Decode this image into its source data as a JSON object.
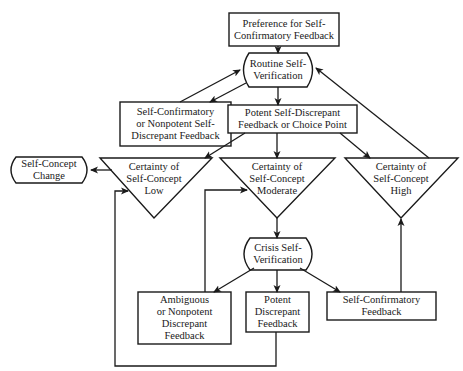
{
  "diagram": {
    "type": "flowchart",
    "colors": {
      "stroke": "#1a1a1a",
      "background": "#ffffff",
      "text": "#1a1a1a"
    },
    "nodes": {
      "preference": {
        "shape": "rectangle",
        "lines": [
          "Preference for Self-",
          "Confirmatory Feedback"
        ]
      },
      "routine": {
        "shape": "rounded-terminal",
        "lines": [
          "Routine Self-",
          "Verification"
        ]
      },
      "nonpotent": {
        "shape": "rectangle",
        "lines": [
          "Self-Confirmatory",
          "or Nonpotent Self-",
          "Discrepant Feedback"
        ]
      },
      "choice_point": {
        "shape": "rectangle",
        "lines": [
          "Potent Self-Discrepant",
          "Feedback or Choice Point"
        ]
      },
      "change": {
        "shape": "rounded-terminal",
        "lines": [
          "Self-Concept",
          "Change"
        ]
      },
      "low": {
        "shape": "inverted-triangle",
        "lines": [
          "Certainty of",
          "Self-Concept",
          "Low"
        ]
      },
      "moderate": {
        "shape": "inverted-triangle",
        "lines": [
          "Certainty of",
          "Self-Concept",
          "Moderate"
        ]
      },
      "high": {
        "shape": "inverted-triangle",
        "lines": [
          "Certainty of",
          "Self-Concept",
          "High"
        ]
      },
      "crisis": {
        "shape": "rounded-terminal",
        "lines": [
          "Crisis Self-",
          "Verification"
        ]
      },
      "ambiguous": {
        "shape": "rectangle",
        "lines": [
          "Ambiguous",
          "or Nonpotent",
          "Discrepant",
          "Feedback"
        ]
      },
      "potent": {
        "shape": "rectangle",
        "lines": [
          "Potent",
          "Discrepant",
          "Feedback"
        ]
      },
      "confirm_bottom": {
        "shape": "rectangle",
        "lines": [
          "Self-Confirmatory",
          "Feedback"
        ]
      }
    },
    "edges": [
      {
        "from": "preference",
        "to": "routine"
      },
      {
        "from": "routine",
        "to": "nonpotent"
      },
      {
        "from": "nonpotent",
        "to": "routine"
      },
      {
        "from": "routine",
        "to": "choice_point"
      },
      {
        "from": "choice_point",
        "to": "low"
      },
      {
        "from": "choice_point",
        "to": "moderate"
      },
      {
        "from": "choice_point",
        "to": "high"
      },
      {
        "from": "high",
        "to": "routine"
      },
      {
        "from": "low",
        "to": "change"
      },
      {
        "from": "moderate",
        "to": "crisis"
      },
      {
        "from": "crisis",
        "to": "ambiguous"
      },
      {
        "from": "crisis",
        "to": "potent"
      },
      {
        "from": "crisis",
        "to": "confirm_bottom"
      },
      {
        "from": "ambiguous",
        "to": "moderate"
      },
      {
        "from": "potent",
        "to": "low"
      },
      {
        "from": "confirm_bottom",
        "to": "high"
      }
    ]
  }
}
